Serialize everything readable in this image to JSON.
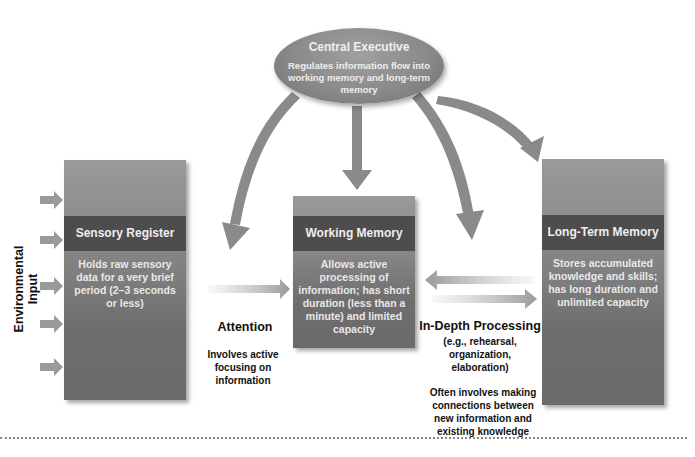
{
  "central_executive": {
    "title": "Central Executive",
    "description": "Regulates information flow into working memory and long-term memory"
  },
  "side_label": "Environmental Input",
  "boxes": {
    "sensory_register": {
      "title": "Sensory Register",
      "description": "Holds raw sensory data for a very brief period (2–3 seconds or less)"
    },
    "working_memory": {
      "title": "Working Memory",
      "description": "Allows active processing of information; has short duration (less than a minute) and limited capacity"
    },
    "long_term_memory": {
      "title": "Long-Term Memory",
      "description": "Stores accumulated knowledge and skills; has long duration and unlimited capacity"
    }
  },
  "processes": {
    "attention": {
      "title": "Attention",
      "description": "Involves active focusing on information"
    },
    "in_depth_processing": {
      "title": "In-Depth Processing",
      "examples": "(e.g., rehearsal, organization, elaboration)",
      "description": "Often involves making connections between new information and existing knowledge"
    }
  },
  "colors": {
    "box_gray": "#888888",
    "band_dark": "#4d4d4d",
    "arrow_gray": "#8a8a8a",
    "text_dark": "#111111",
    "text_light": "#eeeeee"
  }
}
